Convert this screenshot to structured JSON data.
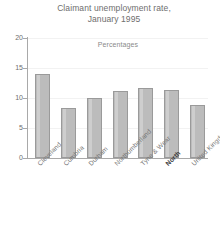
{
  "chart_data": {
    "type": "bar",
    "title": "Claimant unemployment rate, January 1995",
    "title_lines": [
      "Claimant unemployment rate,",
      "January 1995"
    ],
    "subtitle": "Percentages",
    "xlabel": "",
    "ylabel": "",
    "ylim": [
      0,
      20
    ],
    "yticks": [
      0,
      5,
      10,
      15,
      20
    ],
    "ytick_labels": [
      "0",
      "5",
      "10",
      "15",
      "20"
    ],
    "grid": true,
    "legend": "none",
    "categories": [
      "Cleveland",
      "Cumbria",
      "Durham",
      "Northumberland",
      "Tyne & Wear",
      "North",
      "United Kingdom"
    ],
    "values": [
      14.0,
      8.3,
      10.0,
      11.2,
      11.7,
      11.3,
      8.8
    ],
    "emphasised_category": "North",
    "bar_color": "#bcbcbc",
    "bar_edge_color": "#9a9a9a",
    "axis_color": "#a9a9a9",
    "grid_color": "#f2f2f2",
    "text_color": "#6e6e6e"
  }
}
